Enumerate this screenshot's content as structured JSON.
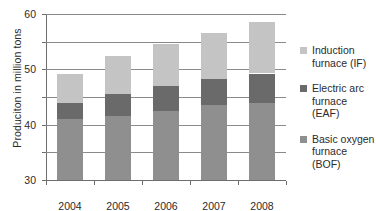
{
  "chart_data": {
    "type": "bar",
    "subtype": "stacked-vertical",
    "title": "",
    "xlabel": "",
    "ylabel": "Produciton in million tons",
    "categories": [
      "2004",
      "2005",
      "2006",
      "2007",
      "2008"
    ],
    "ylim": [
      0,
      60
    ],
    "yticks": [
      0,
      10,
      20,
      30,
      40,
      50,
      60
    ],
    "grid": "horizontal",
    "legend_position": "right",
    "series": [
      {
        "name": "Basic oxygen\nfurnace (BOF)",
        "key": "bof",
        "color": "#8f8f8f",
        "values": [
          22,
          23,
          25,
          27,
          28
        ]
      },
      {
        "name": "Electric arc\nfurnace (EAF)",
        "key": "eaf",
        "color": "#6a6a6a",
        "values": [
          6,
          8,
          9,
          9.5,
          10.5
        ]
      },
      {
        "name": "Induction\nfurnace (IF)",
        "key": "if",
        "color": "#c4c4c4",
        "values": [
          10.5,
          14,
          15,
          16.5,
          18.5
        ]
      }
    ],
    "totals": [
      38.5,
      45,
      49,
      53,
      57
    ]
  },
  "axis": {
    "y_labels": [
      "60",
      "50",
      "40",
      "30",
      "20",
      "10",
      "0"
    ],
    "x_labels": [
      "2004",
      "2005",
      "2006",
      "2007",
      "2008"
    ],
    "y_title": "Produciton in million tons"
  },
  "legend": {
    "entries": [
      {
        "label": "Induction\nfurnace (IF)",
        "color": "#c4c4c4"
      },
      {
        "label": "Electric arc\nfurnace (EAF)",
        "color": "#6a6a6a"
      },
      {
        "label": "Basic oxygen\nfurnace (BOF)",
        "color": "#8f8f8f"
      }
    ]
  }
}
